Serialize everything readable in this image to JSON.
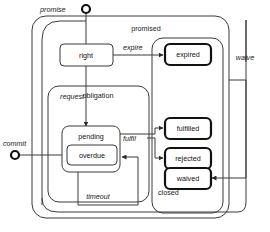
{
  "diagram": {
    "type": "uml-state-machine",
    "background_color": "#ffffff",
    "line_color": "#3a3a3a",
    "accent_color": "#111111"
  },
  "regions": [
    {
      "id": "promised",
      "label": "promised"
    },
    {
      "id": "obligation",
      "label": "obligation"
    },
    {
      "id": "closed",
      "label": "closed"
    }
  ],
  "states": [
    {
      "id": "right",
      "label": "right",
      "style": "simple"
    },
    {
      "id": "pending",
      "label": "pending",
      "style": "simple"
    },
    {
      "id": "overdue",
      "label": "overdue",
      "style": "simple"
    },
    {
      "id": "expired",
      "label": "expired",
      "style": "final"
    },
    {
      "id": "fulfilled",
      "label": "fulfilled",
      "style": "final"
    },
    {
      "id": "rejected",
      "label": "rejected",
      "style": "final"
    },
    {
      "id": "waived",
      "label": "waived",
      "style": "final"
    }
  ],
  "initial_pseudostates": [
    {
      "id": "promise-entry",
      "label": "promise"
    },
    {
      "id": "commit-entry",
      "label": "commit"
    }
  ],
  "transitions": [
    {
      "id": "t-promise",
      "label": "promise",
      "from": "start",
      "to": "promised"
    },
    {
      "id": "t-request",
      "label": "request",
      "from": "right",
      "to": "pending"
    },
    {
      "id": "t-expire",
      "label": "expire",
      "from": "right",
      "to": "expired"
    },
    {
      "id": "t-fulfil",
      "label": "fulfil",
      "from": "pending",
      "to": "fulfilled"
    },
    {
      "id": "t-timeout",
      "label": "timeout",
      "from": "pending",
      "to": "overdue"
    },
    {
      "id": "t-commit",
      "label": "commit",
      "from": "start",
      "to": "overdue"
    },
    {
      "id": "t-waive",
      "label": "waive",
      "from": "promised",
      "to": "waived"
    },
    {
      "id": "t-reject",
      "label": "",
      "from": "pending",
      "to": "rejected"
    }
  ]
}
